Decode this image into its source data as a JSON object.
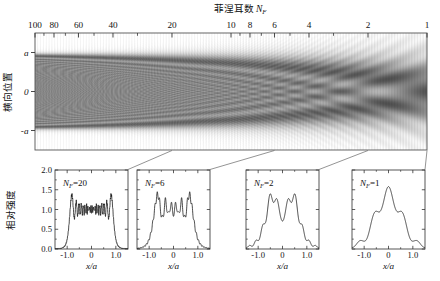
{
  "figure": {
    "main": {
      "top_axis_title": "菲涅耳数 N_F",
      "top_axis_title_main": "菲涅耳数",
      "top_axis_title_sym": "N",
      "top_axis_title_sub": "F",
      "y_axis_label": "横向位置",
      "y_ticks": [
        "a",
        "0",
        "-a"
      ],
      "x_ticks": [
        "100",
        "80",
        "60",
        "40",
        "20",
        "10",
        "8",
        "6",
        "4",
        "2",
        "1"
      ],
      "x_minor_ticks": [
        90,
        70,
        50,
        30,
        9,
        7,
        5,
        3
      ],
      "colormap": "grayscale",
      "interior_gray": "#8a8a8a",
      "band_dark": "#4a4a4a"
    },
    "subplots": [
      {
        "label": "N_F=20",
        "label_sym": "N",
        "label_sub": "F",
        "label_val": "=20",
        "nf": 20,
        "y_axis_label": "相对强度",
        "x_axis_label": "x/a",
        "y_ticks": [
          "0.0",
          "0.5",
          "1.0",
          "1.5",
          "2.0"
        ],
        "x_ticks": [
          "-1.0",
          "0",
          "1.0"
        ]
      },
      {
        "label": "N_F=6",
        "label_sym": "N",
        "label_sub": "F",
        "label_val": "=6",
        "nf": 6,
        "x_axis_label": "x/a",
        "y_ticks": [
          "0.0",
          "0.5",
          "1.0",
          "1.5",
          "2.0"
        ],
        "x_ticks": [
          "-1.0",
          "0",
          "1.0"
        ]
      },
      {
        "label": "N_F=2",
        "label_sym": "N",
        "label_sub": "F",
        "label_val": "=2",
        "nf": 2,
        "x_axis_label": "x/a",
        "y_ticks": [
          "0.0",
          "0.5",
          "1.0",
          "1.5",
          "2.0"
        ],
        "x_ticks": [
          "-1.0",
          "0",
          "1.0"
        ]
      },
      {
        "label": "N_F=1",
        "label_sym": "N",
        "label_sub": "F",
        "label_val": "=1",
        "nf": 1,
        "x_axis_label": "x/a",
        "y_ticks": [
          "0.0",
          "0.5",
          "1.0",
          "1.5",
          "2.0"
        ],
        "x_ticks": [
          "-1.0",
          "0",
          "1.0"
        ]
      }
    ]
  },
  "chart_data": [
    {
      "type": "heatmap",
      "title": "菲涅耳数 N_F",
      "xlabel": "菲涅耳数 N_F",
      "ylabel": "横向位置",
      "xscale": "log-reversed",
      "xlim": [
        100,
        1
      ],
      "ylim": [
        -1.5,
        1.5
      ],
      "ytick_labels": [
        "a",
        "0",
        "-a"
      ],
      "ytick_values": [
        1,
        0,
        -1
      ],
      "xtick_labels": [
        "100",
        "80",
        "60",
        "40",
        "20",
        "10",
        "8",
        "6",
        "4",
        "2",
        "1"
      ],
      "xtick_values": [
        100,
        80,
        60,
        40,
        20,
        10,
        8,
        6,
        4,
        2,
        1
      ],
      "description": "Fresnel diffraction intensity of a slit of half-width a versus Fresnel number; dark = high intensity; caustic fishbone fringes converge toward low N_F",
      "grid": false,
      "legend": "none"
    },
    {
      "type": "line",
      "title": "N_F=20",
      "xlabel": "x/a",
      "ylabel": "相对强度",
      "xlim": [
        -1.5,
        1.5
      ],
      "ylim": [
        0.0,
        2.0
      ],
      "xtick_values": [
        -1.0,
        0,
        1.0
      ],
      "xtick_labels": [
        "-1.0",
        "0",
        "1.0"
      ],
      "ytick_values": [
        0.0,
        0.5,
        1.0,
        1.5,
        2.0
      ],
      "ytick_labels": [
        "0.0",
        "0.5",
        "1.0",
        "1.5",
        "2.0"
      ],
      "grid": false,
      "legend": "none",
      "x": [
        -1.5,
        -1.4,
        -1.3,
        -1.2,
        -1.15,
        -1.1,
        -1.06,
        -1.02,
        -0.99,
        -0.96,
        -0.93,
        -0.9,
        -0.87,
        -0.84,
        -0.81,
        -0.78,
        -0.75,
        -0.72,
        -0.69,
        -0.66,
        -0.63,
        -0.6,
        -0.57,
        -0.54,
        -0.51,
        -0.48,
        -0.45,
        -0.42,
        -0.39,
        -0.36,
        -0.33,
        -0.3,
        -0.27,
        -0.24,
        -0.21,
        -0.18,
        -0.15,
        -0.12,
        -0.09,
        -0.06,
        -0.03,
        0.0,
        0.03,
        0.06,
        0.09,
        0.12,
        0.15,
        0.18,
        0.21,
        0.24,
        0.27,
        0.3,
        0.33,
        0.36,
        0.39,
        0.42,
        0.45,
        0.48,
        0.51,
        0.54,
        0.57,
        0.6,
        0.63,
        0.66,
        0.69,
        0.72,
        0.75,
        0.78,
        0.81,
        0.84,
        0.87,
        0.9,
        0.93,
        0.96,
        0.99,
        1.02,
        1.06,
        1.1,
        1.15,
        1.2,
        1.3,
        1.4,
        1.5
      ],
      "values": [
        0.0,
        0.01,
        0.02,
        0.05,
        0.1,
        0.25,
        0.55,
        0.95,
        1.25,
        1.38,
        1.2,
        1.02,
        1.3,
        1.36,
        1.08,
        0.92,
        1.22,
        1.3,
        1.0,
        0.88,
        1.18,
        1.24,
        0.96,
        0.9,
        1.12,
        1.16,
        0.94,
        0.92,
        1.08,
        1.1,
        0.95,
        0.93,
        1.05,
        1.07,
        0.96,
        0.95,
        1.04,
        1.05,
        0.97,
        0.96,
        1.03,
        1.0,
        1.03,
        0.96,
        0.97,
        1.05,
        1.04,
        0.95,
        0.96,
        1.07,
        1.05,
        0.93,
        0.95,
        1.1,
        1.08,
        0.92,
        0.94,
        1.16,
        1.12,
        0.9,
        0.96,
        1.24,
        1.18,
        0.88,
        1.0,
        1.3,
        1.22,
        0.92,
        1.08,
        1.36,
        1.3,
        1.02,
        1.2,
        1.38,
        1.25,
        0.95,
        0.55,
        0.25,
        0.1,
        0.05,
        0.02,
        0.01,
        0.0
      ]
    },
    {
      "type": "line",
      "title": "N_F=6",
      "xlabel": "x/a",
      "ylabel": "相对强度",
      "xlim": [
        -1.5,
        1.5
      ],
      "ylim": [
        0.0,
        2.0
      ],
      "xtick_values": [
        -1.0,
        0,
        1.0
      ],
      "xtick_labels": [
        "-1.0",
        "0",
        "1.0"
      ],
      "ytick_values": [
        0.0,
        0.5,
        1.0,
        1.5,
        2.0
      ],
      "ytick_labels": [
        "0.0",
        "0.5",
        "1.0",
        "1.5",
        "2.0"
      ],
      "grid": false,
      "legend": "none",
      "x": [
        -1.5,
        -1.4,
        -1.32,
        -1.25,
        -1.18,
        -1.12,
        -1.06,
        -1.0,
        -0.94,
        -0.88,
        -0.82,
        -0.76,
        -0.7,
        -0.64,
        -0.58,
        -0.52,
        -0.46,
        -0.4,
        -0.34,
        -0.28,
        -0.22,
        -0.16,
        -0.1,
        -0.05,
        0.0,
        0.05,
        0.1,
        0.16,
        0.22,
        0.28,
        0.34,
        0.4,
        0.46,
        0.52,
        0.58,
        0.64,
        0.7,
        0.76,
        0.82,
        0.88,
        0.94,
        1.0,
        1.06,
        1.12,
        1.18,
        1.25,
        1.32,
        1.4,
        1.5
      ],
      "values": [
        0.0,
        0.02,
        0.05,
        0.1,
        0.18,
        0.3,
        0.48,
        0.7,
        0.95,
        1.22,
        1.45,
        1.2,
        0.95,
        1.25,
        1.05,
        0.8,
        1.18,
        1.0,
        0.78,
        1.12,
        0.95,
        0.8,
        1.18,
        0.98,
        0.88,
        1.0,
        1.18,
        0.82,
        0.95,
        1.12,
        0.78,
        1.02,
        1.18,
        0.82,
        1.05,
        1.28,
        0.95,
        1.22,
        1.48,
        1.2,
        0.95,
        0.7,
        0.48,
        0.3,
        0.18,
        0.1,
        0.05,
        0.02,
        0.0
      ]
    },
    {
      "type": "line",
      "title": "N_F=2",
      "xlabel": "x/a",
      "ylabel": "相对强度",
      "xlim": [
        -1.5,
        1.5
      ],
      "ylim": [
        0.0,
        2.0
      ],
      "xtick_values": [
        -1.0,
        0,
        1.0
      ],
      "xtick_labels": [
        "-1.0",
        "0",
        "1.0"
      ],
      "ytick_values": [
        0.0,
        0.5,
        1.0,
        1.5,
        2.0
      ],
      "ytick_labels": [
        "0.0",
        "0.5",
        "1.0",
        "1.5",
        "2.0"
      ],
      "grid": false,
      "legend": "none",
      "x": [
        -1.5,
        -1.42,
        -1.34,
        -1.26,
        -1.18,
        -1.1,
        -1.02,
        -0.94,
        -0.86,
        -0.78,
        -0.7,
        -0.62,
        -0.55,
        -0.48,
        -0.4,
        -0.32,
        -0.24,
        -0.16,
        -0.08,
        0.0,
        0.08,
        0.16,
        0.24,
        0.32,
        0.4,
        0.48,
        0.55,
        0.62,
        0.7,
        0.78,
        0.86,
        0.94,
        1.02,
        1.1,
        1.18,
        1.26,
        1.34,
        1.42,
        1.5
      ],
      "values": [
        0.02,
        0.06,
        0.12,
        0.1,
        0.18,
        0.3,
        0.42,
        0.58,
        0.75,
        0.95,
        1.15,
        1.32,
        1.38,
        1.3,
        1.2,
        1.28,
        1.18,
        0.98,
        0.88,
        0.84,
        0.88,
        0.98,
        1.18,
        1.28,
        1.2,
        1.3,
        1.38,
        1.32,
        1.15,
        0.95,
        0.75,
        0.58,
        0.42,
        0.3,
        0.18,
        0.1,
        0.12,
        0.06,
        0.02
      ]
    },
    {
      "type": "line",
      "title": "N_F=1",
      "xlabel": "x/a",
      "ylabel": "相对强度",
      "xlim": [
        -1.5,
        1.5
      ],
      "ylim": [
        0.0,
        2.0
      ],
      "xtick_values": [
        -1.0,
        0,
        1.0
      ],
      "xtick_labels": [
        "-1.0",
        "0",
        "1.0"
      ],
      "ytick_values": [
        0.0,
        0.5,
        1.0,
        1.5,
        2.0
      ],
      "ytick_labels": [
        "0.0",
        "0.5",
        "1.0",
        "1.5",
        "2.0"
      ],
      "grid": false,
      "legend": "none",
      "x": [
        -1.5,
        -1.42,
        -1.34,
        -1.26,
        -1.18,
        -1.1,
        -1.02,
        -0.94,
        -0.86,
        -0.78,
        -0.7,
        -0.62,
        -0.54,
        -0.46,
        -0.38,
        -0.3,
        -0.22,
        -0.14,
        -0.07,
        0.0,
        0.07,
        0.14,
        0.22,
        0.3,
        0.38,
        0.46,
        0.54,
        0.62,
        0.7,
        0.78,
        0.86,
        0.94,
        1.02,
        1.1,
        1.18,
        1.26,
        1.34,
        1.42,
        1.5
      ],
      "values": [
        0.02,
        0.06,
        0.14,
        0.2,
        0.22,
        0.18,
        0.16,
        0.22,
        0.34,
        0.5,
        0.68,
        0.85,
        0.95,
        0.97,
        0.95,
        0.98,
        1.12,
        1.38,
        1.54,
        1.56,
        1.54,
        1.38,
        1.12,
        0.98,
        0.95,
        0.97,
        0.95,
        0.85,
        0.68,
        0.5,
        0.34,
        0.22,
        0.16,
        0.18,
        0.22,
        0.2,
        0.14,
        0.06,
        0.02
      ]
    }
  ]
}
